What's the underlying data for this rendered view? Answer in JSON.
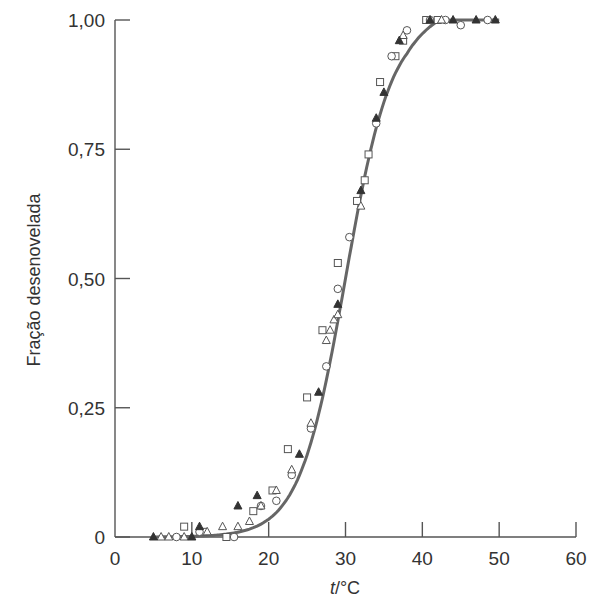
{
  "chart_data": {
    "type": "scatter",
    "title": "",
    "xlabel_italic": "t",
    "xlabel_rest": "/°C",
    "xlabel": "t/°C",
    "ylabel": "Fração desenovelada",
    "xlim": [
      0,
      60
    ],
    "ylim": [
      0,
      1
    ],
    "grid": false,
    "legend": "none",
    "x_ticks": [
      0,
      10,
      20,
      30,
      40,
      50,
      60
    ],
    "x_tick_labels": [
      "0",
      "10",
      "20",
      "30",
      "40",
      "50",
      "60"
    ],
    "y_ticks": [
      0,
      0.25,
      0.5,
      0.75,
      1.0
    ],
    "y_tick_labels": [
      "0",
      "0,25",
      "0,50",
      "0,75",
      "1,00"
    ],
    "fit_curve": {
      "type": "sigmoid",
      "midpoint": 30,
      "description": "fitted sigmoid curve",
      "color": "#666666"
    },
    "series": [
      {
        "name": "open-squares",
        "marker": "square-open",
        "points": [
          [
            9,
            0.02
          ],
          [
            11.5,
            0.01
          ],
          [
            14.5,
            0.0
          ],
          [
            18,
            0.05
          ],
          [
            20.5,
            0.09
          ],
          [
            22.5,
            0.17
          ],
          [
            25,
            0.27
          ],
          [
            27,
            0.4
          ],
          [
            29,
            0.53
          ],
          [
            31.5,
            0.65
          ],
          [
            32.5,
            0.69
          ],
          [
            33,
            0.74
          ],
          [
            34.5,
            0.88
          ],
          [
            36.5,
            0.93
          ],
          [
            37.5,
            0.96
          ],
          [
            40.5,
            1.0
          ],
          [
            42,
            1.0
          ]
        ]
      },
      {
        "name": "open-circles",
        "marker": "circle-open",
        "points": [
          [
            8,
            0.0
          ],
          [
            11,
            0.01
          ],
          [
            15.5,
            0.0
          ],
          [
            19,
            0.06
          ],
          [
            21,
            0.07
          ],
          [
            23,
            0.12
          ],
          [
            25.5,
            0.21
          ],
          [
            27.5,
            0.33
          ],
          [
            29,
            0.48
          ],
          [
            30.5,
            0.58
          ],
          [
            34,
            0.8
          ],
          [
            36,
            0.93
          ],
          [
            38,
            0.98
          ],
          [
            41,
            1.0
          ],
          [
            43,
            1.0
          ],
          [
            45,
            0.99
          ],
          [
            48.5,
            1.0
          ]
        ]
      },
      {
        "name": "open-triangles",
        "marker": "triangle-open",
        "points": [
          [
            6,
            0.0
          ],
          [
            7,
            0.0
          ],
          [
            9,
            0.0
          ],
          [
            12,
            0.01
          ],
          [
            14,
            0.02
          ],
          [
            16,
            0.02
          ],
          [
            17.5,
            0.03
          ],
          [
            19,
            0.06
          ],
          [
            21,
            0.09
          ],
          [
            23,
            0.13
          ],
          [
            25.5,
            0.22
          ],
          [
            27.5,
            0.38
          ],
          [
            28,
            0.4
          ],
          [
            28.5,
            0.42
          ],
          [
            29,
            0.43
          ],
          [
            32,
            0.64
          ],
          [
            37.5,
            0.97
          ],
          [
            42.5,
            1.0
          ]
        ]
      },
      {
        "name": "filled-triangles",
        "marker": "triangle-filled",
        "points": [
          [
            5,
            0.0
          ],
          [
            10,
            0.0
          ],
          [
            11,
            0.02
          ],
          [
            16,
            0.06
          ],
          [
            18.5,
            0.08
          ],
          [
            24,
            0.16
          ],
          [
            26.5,
            0.28
          ],
          [
            29,
            0.45
          ],
          [
            32,
            0.67
          ],
          [
            34,
            0.81
          ],
          [
            35,
            0.86
          ],
          [
            37,
            0.96
          ],
          [
            41,
            1.0
          ],
          [
            44,
            1.0
          ],
          [
            47,
            1.0
          ],
          [
            49.5,
            1.0
          ]
        ]
      }
    ]
  }
}
